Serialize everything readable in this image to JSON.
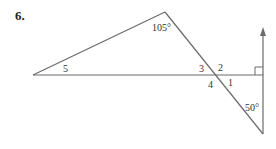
{
  "problem": {
    "number": "6."
  },
  "figure": {
    "line_color": "#6b6b6b",
    "label_color": "#333333",
    "points": {
      "left_vertex": [
        33,
        75
      ],
      "apex": [
        165,
        12
      ],
      "intersection": [
        215,
        75
      ],
      "bottom_vertex": [
        263,
        134
      ],
      "arrow_tip": [
        263,
        28
      ],
      "right_end": [
        263,
        75
      ]
    },
    "labels": {
      "angle_apex": "105°",
      "angle_5": "5",
      "angle_3": "3",
      "angle_2": "2",
      "angle_4": "4",
      "angle_1": "1",
      "angle_bottom": "50°"
    },
    "right_angle_marker": {
      "size": 8
    }
  }
}
